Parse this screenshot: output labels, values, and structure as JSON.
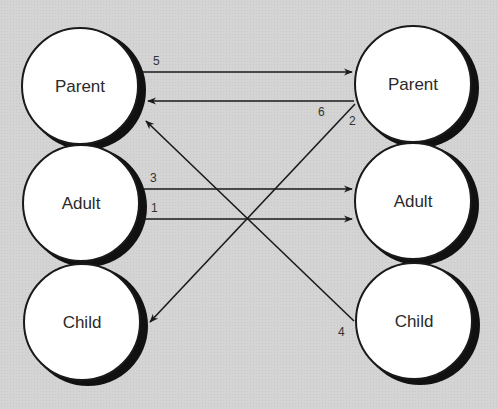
{
  "diagram": {
    "type": "transactional-analysis",
    "left_states": [
      {
        "label": "Parent"
      },
      {
        "label": "Adult"
      },
      {
        "label": "Child"
      }
    ],
    "right_states": [
      {
        "label": "Parent"
      },
      {
        "label": "Adult"
      },
      {
        "label": "Child"
      }
    ],
    "transactions": [
      {
        "number": "5",
        "from": "left-parent",
        "to": "right-parent"
      },
      {
        "number": "6",
        "from": "right-parent",
        "to": "left-parent"
      },
      {
        "number": "3",
        "from": "left-adult",
        "to": "right-adult"
      },
      {
        "number": "1",
        "from": "left-adult",
        "to": "right-adult"
      },
      {
        "number": "2",
        "from": "right-parent",
        "to": "left-child"
      },
      {
        "number": "4",
        "from": "right-child",
        "to": "left-parent"
      }
    ],
    "colors": {
      "background": "#d4d4d4",
      "circle_fill": "#ffffff",
      "stroke": "#1a1a1a",
      "shadow": "#111111"
    }
  }
}
